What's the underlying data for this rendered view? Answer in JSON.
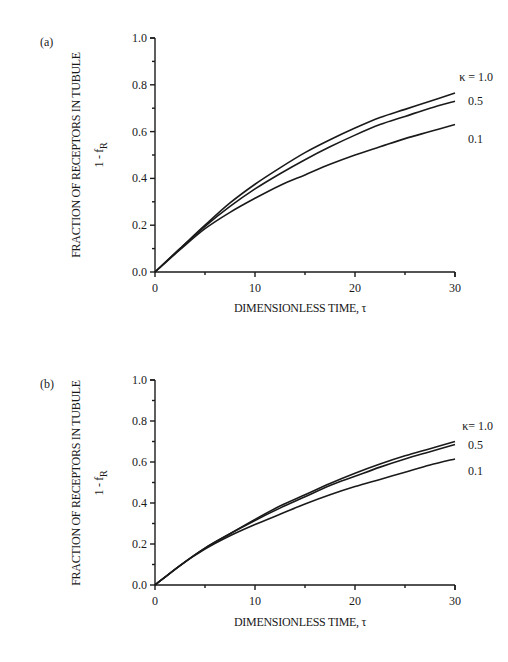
{
  "chart_data": [
    {
      "type": "line",
      "panel": "(a)",
      "title": "",
      "xlabel": "DIMENSIONLESS TIME,  τ",
      "ylabel": "FRACTION OF RECEPTORS IN TUBULE",
      "ylabel_sub": "1 - f",
      "ylabel_subscript": "R",
      "xlim": [
        0,
        30
      ],
      "ylim": [
        0,
        1.0
      ],
      "x_ticks": [
        "0",
        "10",
        "20",
        "30"
      ],
      "y_ticks": [
        "0.0",
        "0.2",
        "0.4",
        "0.6",
        "0.8",
        "1.0"
      ],
      "grid": false,
      "legend_position": "inline-right",
      "x": [
        0,
        2.5,
        5,
        7.5,
        10,
        12.5,
        15,
        17.5,
        20,
        22.5,
        25,
        27.5,
        30
      ],
      "series": [
        {
          "name": "κ = 1.0",
          "label": "κ = 1.0",
          "values": [
            0,
            0.1,
            0.2,
            0.295,
            0.375,
            0.445,
            0.51,
            0.565,
            0.615,
            0.66,
            0.695,
            0.73,
            0.765
          ]
        },
        {
          "name": "0.5",
          "label": "0.5",
          "values": [
            0,
            0.1,
            0.195,
            0.28,
            0.355,
            0.42,
            0.48,
            0.535,
            0.585,
            0.63,
            0.665,
            0.7,
            0.73
          ]
        },
        {
          "name": "0.1",
          "label": "0.1",
          "values": [
            0,
            0.095,
            0.185,
            0.255,
            0.315,
            0.37,
            0.415,
            0.46,
            0.5,
            0.535,
            0.57,
            0.6,
            0.63
          ]
        }
      ]
    },
    {
      "type": "line",
      "panel": "(b)",
      "title": "",
      "xlabel": "DIMENSIONLESS TIME,  τ",
      "ylabel": "FRACTION OF RECEPTORS IN TUBULE",
      "ylabel_sub": "1 - f",
      "ylabel_subscript": "R",
      "xlim": [
        0,
        30
      ],
      "ylim": [
        0,
        1.0
      ],
      "x_ticks": [
        "0",
        "10",
        "20",
        "30"
      ],
      "y_ticks": [
        "0.0",
        "0.2",
        "0.4",
        "0.6",
        "0.8",
        "1.0"
      ],
      "grid": false,
      "legend_position": "inline-right",
      "x": [
        0,
        2.5,
        5,
        7.5,
        10,
        12.5,
        15,
        17.5,
        20,
        22.5,
        25,
        27.5,
        30
      ],
      "series": [
        {
          "name": "κ= 1.0",
          "label": "κ= 1.0",
          "values": [
            0,
            0.095,
            0.18,
            0.25,
            0.32,
            0.385,
            0.44,
            0.495,
            0.545,
            0.59,
            0.63,
            0.665,
            0.7
          ]
        },
        {
          "name": "0.5",
          "label": "0.5",
          "values": [
            0,
            0.095,
            0.18,
            0.25,
            0.315,
            0.375,
            0.43,
            0.485,
            0.53,
            0.575,
            0.615,
            0.65,
            0.685
          ]
        },
        {
          "name": "0.1",
          "label": "0.1",
          "values": [
            0,
            0.095,
            0.175,
            0.24,
            0.295,
            0.345,
            0.395,
            0.44,
            0.48,
            0.515,
            0.55,
            0.585,
            0.615
          ]
        }
      ]
    }
  ]
}
